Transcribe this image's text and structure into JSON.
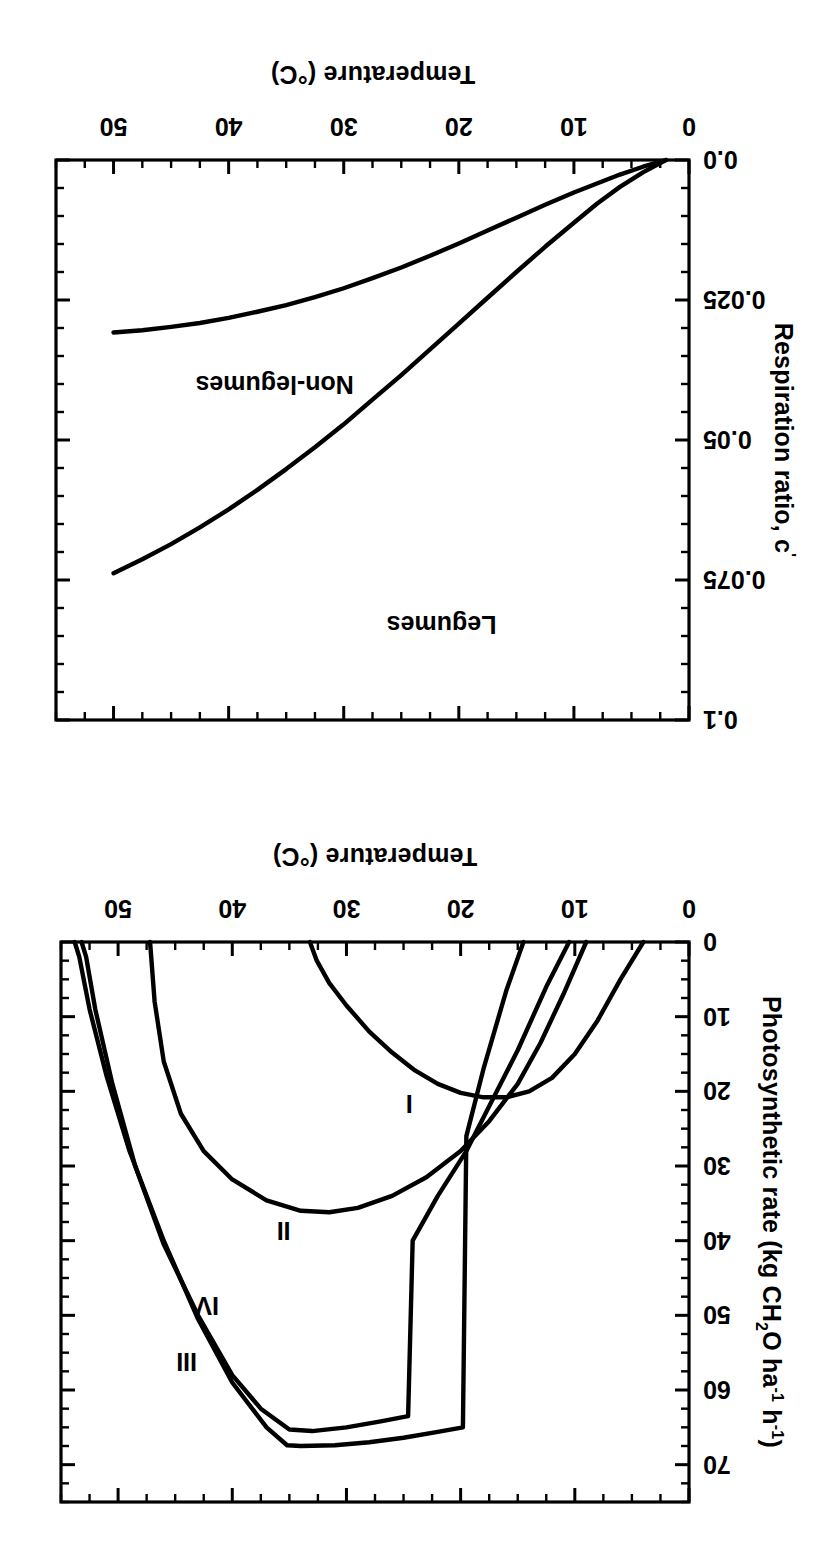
{
  "figure": {
    "orientation": "rotated-180",
    "background": "#ffffff",
    "ink": "#000000"
  },
  "chart_data": [
    {
      "id": "photosynthesis-panel",
      "type": "line",
      "title": "",
      "xlabel": "Temperature (°C)",
      "ylabel": "Photosynthetic rate (kg CH2O ha-1 h-1)",
      "ylabel_parts": {
        "lead": "Photosynthetic rate (kg CH",
        "sub1": "2",
        "mid": "O ha",
        "sup1": "-1",
        "mid2": " h",
        "sup2": "-1",
        "tail": ")"
      },
      "xlim": [
        0,
        55
      ],
      "ylim": [
        0,
        75
      ],
      "xticks": [
        0,
        10,
        20,
        30,
        40,
        50
      ],
      "xtick_labels": [
        "0",
        "10",
        "20",
        "30",
        "40",
        "50"
      ],
      "xminor_step": 2.5,
      "yticks": [
        0,
        10,
        20,
        30,
        40,
        50,
        60,
        70
      ],
      "ytick_labels": [
        "0",
        "10",
        "20",
        "30",
        "40",
        "50",
        "60",
        "70"
      ],
      "yminor_step": 2.5,
      "grid": false,
      "legend": "inline-annotations",
      "series": [
        {
          "name": "I",
          "label": "I",
          "label_x": 24.5,
          "label_y": 20.5,
          "points": [
            [
              4.0,
              0.0
            ],
            [
              6.0,
              5.0
            ],
            [
              8.0,
              10.5
            ],
            [
              10.0,
              15.0
            ],
            [
              12.0,
              18.2
            ],
            [
              14.0,
              20.0
            ],
            [
              16.0,
              20.8
            ],
            [
              18.0,
              20.8
            ],
            [
              20.0,
              20.2
            ],
            [
              22.0,
              19.0
            ],
            [
              24.0,
              17.2
            ],
            [
              26.0,
              14.8
            ],
            [
              28.0,
              12.0
            ],
            [
              30.0,
              8.5
            ],
            [
              31.5,
              5.5
            ],
            [
              32.6,
              2.5
            ],
            [
              33.2,
              0.0
            ]
          ]
        },
        {
          "name": "II",
          "label": "II",
          "label_x": 35.5,
          "label_y": 37.5,
          "points": [
            [
              9.0,
              0.0
            ],
            [
              11.0,
              7.0
            ],
            [
              13.0,
              13.5
            ],
            [
              15.0,
              19.0
            ],
            [
              17.5,
              24.0
            ],
            [
              20.0,
              28.0
            ],
            [
              23.0,
              31.5
            ],
            [
              26.0,
              34.0
            ],
            [
              29.0,
              35.6
            ],
            [
              31.5,
              36.2
            ],
            [
              34.0,
              36.0
            ],
            [
              37.0,
              34.6
            ],
            [
              40.0,
              31.8
            ],
            [
              42.5,
              28.0
            ],
            [
              44.5,
              23.0
            ],
            [
              46.0,
              16.0
            ],
            [
              46.8,
              8.0
            ],
            [
              47.2,
              0.0
            ]
          ]
        },
        {
          "name": "III",
          "label": "III",
          "label_x": 44.0,
          "label_y": 55.0,
          "points": [
            [
              14.5,
              0.0
            ],
            [
              16.0,
              6.5
            ],
            [
              18.0,
              17.0
            ],
            [
              19.5,
              26.0
            ],
            [
              19.8,
              65.0
            ],
            [
              22.0,
              65.6
            ],
            [
              25.0,
              66.4
            ],
            [
              28.0,
              67.0
            ],
            [
              31.0,
              67.4
            ],
            [
              34.0,
              67.5
            ],
            [
              35.2,
              67.4
            ],
            [
              37.0,
              65.0
            ],
            [
              40.0,
              59.0
            ],
            [
              43.0,
              50.5
            ],
            [
              46.0,
              40.0
            ],
            [
              49.0,
              28.0
            ],
            [
              51.0,
              18.0
            ],
            [
              52.5,
              9.0
            ],
            [
              53.4,
              2.0
            ],
            [
              53.8,
              0.0
            ]
          ]
        },
        {
          "name": "IV",
          "label": "IV",
          "label_x": 42.2,
          "label_y": 47.5,
          "points": [
            [
              10.5,
              0.0
            ],
            [
              12.5,
              6.0
            ],
            [
              15.0,
              14.5
            ],
            [
              17.5,
              22.0
            ],
            [
              19.5,
              28.0
            ],
            [
              22.0,
              34.0
            ],
            [
              24.2,
              40.0
            ],
            [
              24.6,
              63.5
            ],
            [
              27.0,
              64.2
            ],
            [
              30.0,
              65.0
            ],
            [
              33.0,
              65.5
            ],
            [
              35.0,
              65.3
            ],
            [
              37.5,
              62.5
            ],
            [
              40.0,
              58.0
            ],
            [
              43.0,
              50.0
            ],
            [
              46.0,
              40.5
            ],
            [
              48.5,
              30.0
            ],
            [
              50.5,
              19.0
            ],
            [
              52.0,
              9.0
            ],
            [
              52.8,
              2.0
            ],
            [
              53.2,
              0.0
            ]
          ]
        }
      ]
    },
    {
      "id": "respiration-ratio-panel",
      "type": "line",
      "title": "",
      "xlabel": "Temperature (°C)",
      "ylabel": "Respiration ratio, c'",
      "xlim": [
        0,
        55
      ],
      "ylim": [
        0,
        0.1
      ],
      "xticks": [
        0,
        10,
        20,
        30,
        40,
        50
      ],
      "xtick_labels": [
        "0",
        "10",
        "20",
        "30",
        "40",
        "50"
      ],
      "xminor_step": 2.5,
      "yticks": [
        0.0,
        0.025,
        0.05,
        0.075,
        0.1
      ],
      "ytick_labels": [
        "0.0",
        "0.025",
        "0.05",
        "0.075",
        "0.1"
      ],
      "yminor_step": 0.005,
      "grid": false,
      "legend": "inline-annotations",
      "series": [
        {
          "name": "Legumes",
          "label": "Legumes",
          "label_x": 21.5,
          "label_y": 0.0815,
          "points": [
            [
              2.0,
              0.0
            ],
            [
              4.0,
              0.0022
            ],
            [
              6.0,
              0.0048
            ],
            [
              8.0,
              0.0078
            ],
            [
              10.0,
              0.0112
            ],
            [
              12.5,
              0.0155
            ],
            [
              15.0,
              0.02
            ],
            [
              17.5,
              0.0246
            ],
            [
              20.0,
              0.0292
            ],
            [
              22.5,
              0.0338
            ],
            [
              25.0,
              0.0384
            ],
            [
              27.5,
              0.0428
            ],
            [
              30.0,
              0.0472
            ],
            [
              32.5,
              0.0513
            ],
            [
              35.0,
              0.0552
            ],
            [
              37.5,
              0.0589
            ],
            [
              40.0,
              0.0624
            ],
            [
              42.5,
              0.0656
            ],
            [
              45.0,
              0.0686
            ],
            [
              47.5,
              0.0713
            ],
            [
              50.0,
              0.0738
            ]
          ]
        },
        {
          "name": "Non-legumes",
          "label": "Non-legumes",
          "label_x": 36.0,
          "label_y": 0.0385,
          "points": [
            [
              2.0,
              0.0
            ],
            [
              4.0,
              0.0012
            ],
            [
              6.0,
              0.0026
            ],
            [
              8.0,
              0.0042
            ],
            [
              10.0,
              0.0058
            ],
            [
              12.5,
              0.008
            ],
            [
              15.0,
              0.0103
            ],
            [
              17.5,
              0.0126
            ],
            [
              20.0,
              0.0149
            ],
            [
              22.5,
              0.0171
            ],
            [
              25.0,
              0.0192
            ],
            [
              27.5,
              0.0211
            ],
            [
              30.0,
              0.0229
            ],
            [
              32.5,
              0.0245
            ],
            [
              35.0,
              0.0259
            ],
            [
              37.5,
              0.0271
            ],
            [
              40.0,
              0.0282
            ],
            [
              42.5,
              0.0291
            ],
            [
              45.0,
              0.0298
            ],
            [
              47.5,
              0.0304
            ],
            [
              50.0,
              0.0308
            ]
          ]
        }
      ]
    }
  ],
  "panels": {
    "photosynthesis": {
      "xlabel": "Temperature (°C)",
      "ylabel_lead": "Photosynthetic rate (kg CH",
      "ylabel_sub1": "2",
      "ylabel_mid": "O ha",
      "ylabel_sup1": "-1",
      "ylabel_mid2": " h",
      "ylabel_sup2": "-1",
      "ylabel_tail": ")",
      "xtick_labels": [
        "0",
        "10",
        "20",
        "30",
        "40",
        "50"
      ],
      "ytick_labels": [
        "0",
        "10",
        "20",
        "30",
        "40",
        "50",
        "60",
        "70"
      ],
      "curve_labels": [
        "I",
        "II",
        "III",
        "IV"
      ]
    },
    "respiration": {
      "xlabel": "Temperature (°C)",
      "ylabel_lead": "Respiration ratio, c",
      "ylabel_prime": "'",
      "xtick_labels": [
        "0",
        "10",
        "20",
        "30",
        "40",
        "50"
      ],
      "ytick_labels": [
        "0.0",
        "0.025",
        "0.05",
        "0.075",
        "0.1"
      ],
      "series_labels": [
        "Legumes",
        "Non-legumes"
      ]
    }
  }
}
